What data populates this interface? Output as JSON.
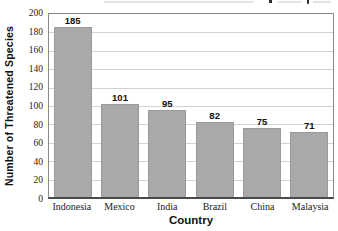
{
  "chart_data": {
    "type": "bar",
    "title": "",
    "categories": [
      "Indonesia",
      "Mexico",
      "India",
      "Brazil",
      "China",
      "Malaysia"
    ],
    "values": [
      185,
      101,
      95,
      82,
      75,
      71
    ],
    "value_labels": [
      "185",
      "101",
      "95",
      "82",
      "75",
      "71"
    ],
    "xlabel": "Country",
    "ylabel": "Number of Threatened Species",
    "ylim": [
      0,
      200
    ],
    "ytick_step": 20,
    "yticks": [
      0,
      20,
      40,
      60,
      80,
      100,
      120,
      140,
      160,
      180,
      200
    ],
    "grid": "on",
    "legend": "none",
    "bar_color": "#a9a9a9",
    "bar_border_color": "#9a9a9a",
    "gridline_color": "#d2d2d2",
    "axis_frame_color": "#8a8a8a",
    "baseline_color": "#4a4a4a"
  }
}
